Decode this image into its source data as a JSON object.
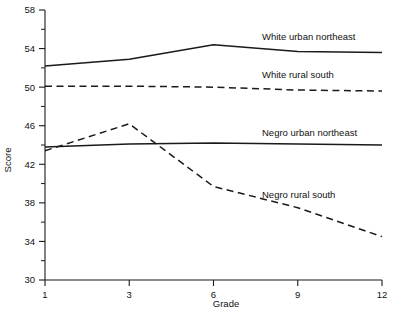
{
  "chart_data": {
    "type": "line",
    "title": "",
    "xlabel": "Grade",
    "ylabel": "Score",
    "categories": [
      "1",
      "3",
      "6",
      "9",
      "12"
    ],
    "x_tick_labels": [
      "1",
      "3",
      "6",
      "9",
      "12"
    ],
    "y_tick_labels": [
      "30",
      "34",
      "38",
      "42",
      "46",
      "50",
      "54",
      "58"
    ],
    "y_tick_values": [
      30,
      34,
      38,
      42,
      46,
      50,
      54,
      58
    ],
    "y_minor_tick_values": [
      32,
      36,
      40,
      44,
      48,
      52,
      56
    ],
    "ylim": [
      30,
      58
    ],
    "grid": false,
    "legend_position": "inline-right",
    "series": [
      {
        "name": "White urban northeast",
        "style": "solid",
        "color": "#1a1a1a",
        "values": [
          52.2,
          52.9,
          54.4,
          53.7,
          53.6
        ],
        "label": "White urban northeast"
      },
      {
        "name": "White rural south",
        "style": "dashed",
        "color": "#1a1a1a",
        "values": [
          50.1,
          50.1,
          50.0,
          49.7,
          49.6
        ],
        "label": "White rural south"
      },
      {
        "name": "Negro urban northeast",
        "style": "solid",
        "color": "#1a1a1a",
        "values": [
          43.8,
          44.1,
          44.2,
          44.1,
          44.0
        ],
        "label": "Negro urban northeast"
      },
      {
        "name": "Negro rural south",
        "style": "dashed",
        "color": "#1a1a1a",
        "values": [
          43.4,
          46.2,
          39.7,
          37.5,
          34.5
        ],
        "label": "Negro rural south"
      }
    ],
    "series_label_anchors": [
      {
        "x": 12,
        "y": 54.9
      },
      {
        "x": 12,
        "y": 50.9
      },
      {
        "x": 12,
        "y": 44.9
      },
      {
        "x": 12,
        "y": 38.5
      }
    ]
  }
}
